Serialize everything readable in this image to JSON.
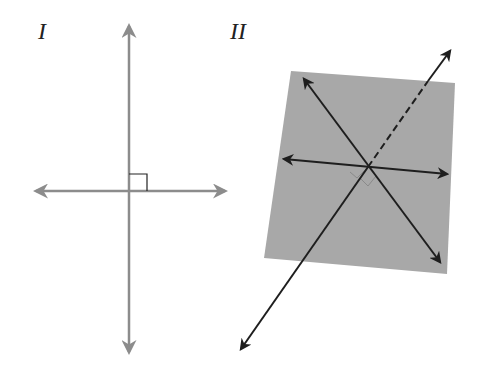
{
  "figures": [
    {
      "label": "I",
      "description": "Two perpendicular lines with right angle mark",
      "line_color": "#8c8c8c"
    },
    {
      "label": "II",
      "description": "Line perpendicular to a plane through two intersecting lines",
      "plane_color": "#a8a8a8",
      "line_color": "#1e1e1e"
    }
  ]
}
